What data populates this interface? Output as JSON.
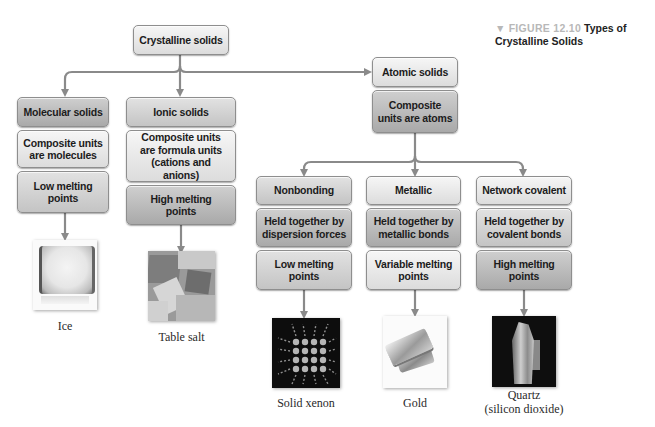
{
  "figure": {
    "marker": "▼",
    "number": "FIGURE 12.10",
    "title_line1": "Types of",
    "title_line2": "Crystalline Solids"
  },
  "colors": {
    "arrow": "#8a8a8a",
    "box_border": "#8e8e8e",
    "caption_number": "#b8b8b8"
  },
  "root": {
    "label": "Crystalline solids"
  },
  "categories": {
    "molecular": {
      "title": "Molecular solids",
      "units": "Composite units are molecules",
      "melting": "Low melting points",
      "example": "Ice"
    },
    "ionic": {
      "title": "Ionic solids",
      "units": "Composite units are formula units (cations and anions)",
      "melting": "High melting points",
      "example": "Table salt"
    },
    "atomic": {
      "title": "Atomic solids",
      "units": "Composite units are atoms",
      "subtypes": {
        "nonbonding": {
          "title": "Nonbonding",
          "force": "Held together by dispersion forces",
          "melting": "Low melting points",
          "example": "Solid xenon"
        },
        "metallic": {
          "title": "Metallic",
          "force": "Held together by metallic bonds",
          "melting": "Variable melting points",
          "example": "Gold"
        },
        "network": {
          "title": "Network covalent",
          "force": "Held together by covalent bonds",
          "melting": "High melting points",
          "example_line1": "Quartz",
          "example_line2": "(silicon dioxide)"
        }
      }
    }
  }
}
